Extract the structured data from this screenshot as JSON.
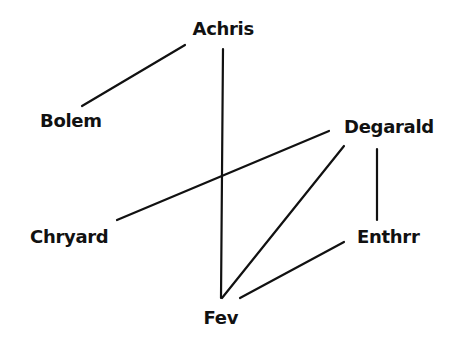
{
  "diagram": {
    "type": "graph",
    "line_color": "#111111",
    "text_color": "#111111",
    "background": "#ffffff",
    "nodes": [
      {
        "id": "achris",
        "label": "Achris",
        "x": 223,
        "y": 29
      },
      {
        "id": "bolem",
        "label": "Bolem",
        "x": 71,
        "y": 121
      },
      {
        "id": "degarald",
        "label": "Degarald",
        "x": 389,
        "y": 127
      },
      {
        "id": "chryard",
        "label": "Chryard",
        "x": 69,
        "y": 237
      },
      {
        "id": "enthrr",
        "label": "Enthrr",
        "x": 388,
        "y": 237
      },
      {
        "id": "fev",
        "label": "Fev",
        "x": 221,
        "y": 318
      }
    ],
    "edges": [
      {
        "from": "achris",
        "to": "bolem",
        "x1": 185,
        "y1": 45,
        "x2": 82,
        "y2": 106
      },
      {
        "from": "achris",
        "to": "fev",
        "x1": 223,
        "y1": 49,
        "x2": 221,
        "y2": 298
      },
      {
        "from": "degarald",
        "to": "chryard",
        "x1": 329,
        "y1": 131,
        "x2": 117,
        "y2": 220
      },
      {
        "from": "degarald",
        "to": "fev",
        "x1": 344,
        "y1": 146,
        "x2": 222,
        "y2": 298
      },
      {
        "from": "degarald",
        "to": "enthrr",
        "x1": 377,
        "y1": 149,
        "x2": 377,
        "y2": 220
      },
      {
        "from": "enthrr",
        "to": "fev",
        "x1": 344,
        "y1": 242,
        "x2": 240,
        "y2": 298
      }
    ]
  },
  "labels": {
    "achris": "Achris",
    "bolem": "Bolem",
    "degarald": "Degarald",
    "chryard": "Chryard",
    "enthrr": "Enthrr",
    "fev": "Fev"
  }
}
